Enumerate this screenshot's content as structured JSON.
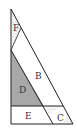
{
  "diagram": {
    "type": "geometric-dissection",
    "colors": {
      "line": "#222222",
      "shaded": "#a8a8a8",
      "background": "#ffffff",
      "pattern": "#888888"
    },
    "regions": [
      {
        "id": "F",
        "label": "F",
        "style": "patterned"
      },
      {
        "id": "B",
        "label": "B",
        "style": "plain"
      },
      {
        "id": "D",
        "label": "D",
        "style": "shaded"
      },
      {
        "id": "E",
        "label": "E",
        "style": "plain"
      },
      {
        "id": "C",
        "label": "C",
        "style": "patterned"
      }
    ]
  }
}
